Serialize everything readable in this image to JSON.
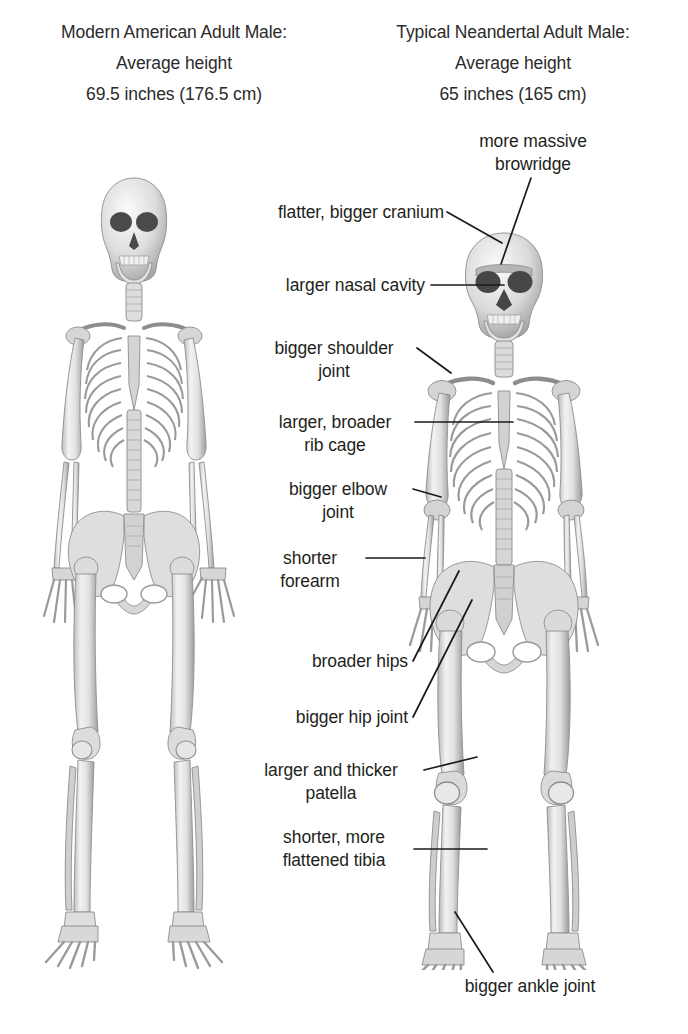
{
  "figure": {
    "title_semantic": "comparison-of-modern-human-and-neandertal-skeletons",
    "background_color": "#ffffff",
    "text_color": "#231f20",
    "bone_fill": "#dcdcdc",
    "bone_outline": "#8d8d8d",
    "leader_color": "#1a1a1a"
  },
  "columns": [
    {
      "id": "modern",
      "heading_line1": "Modern American Adult Male:",
      "heading_line2": "Average height",
      "heading_line3": "69.5 inches (176.5 cm)",
      "height_inches": 69.5,
      "height_cm": 176.5
    },
    {
      "id": "neandertal",
      "heading_line1": "Typical Neandertal Adult Male:",
      "heading_line2": "Average height",
      "heading_line3": "65 inches (165 cm)",
      "height_inches": 65,
      "height_cm": 165
    }
  ],
  "annotations": [
    {
      "id": "browridge",
      "line1": "more massive",
      "line2": "browridge",
      "align": "center"
    },
    {
      "id": "cranium",
      "line1": "flatter, bigger cranium",
      "line2": "",
      "align": "right"
    },
    {
      "id": "nasal-cavity",
      "line1": "larger nasal cavity",
      "line2": "",
      "align": "right"
    },
    {
      "id": "shoulder-joint",
      "line1": "bigger shoulder",
      "line2": "joint",
      "align": "center"
    },
    {
      "id": "rib-cage",
      "line1": "larger, broader",
      "line2": "rib cage",
      "align": "center"
    },
    {
      "id": "elbow-joint",
      "line1": "bigger elbow",
      "line2": "joint",
      "align": "center"
    },
    {
      "id": "forearm",
      "line1": "shorter",
      "line2": "forearm",
      "align": "center"
    },
    {
      "id": "hips",
      "line1": "broader hips",
      "line2": "",
      "align": "right"
    },
    {
      "id": "hip-joint",
      "line1": "bigger hip joint",
      "line2": "",
      "align": "right"
    },
    {
      "id": "patella",
      "line1": "larger and thicker",
      "line2": "patella",
      "align": "center"
    },
    {
      "id": "tibia",
      "line1": "shorter, more",
      "line2": "flattened tibia",
      "align": "center"
    },
    {
      "id": "ankle-joint",
      "line1": "bigger ankle joint",
      "line2": "",
      "align": "center"
    }
  ]
}
